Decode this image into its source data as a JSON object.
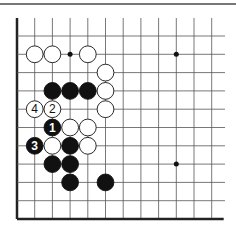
{
  "diagram": {
    "type": "go-board-fragment",
    "grid": {
      "x0": 17,
      "y0": 36,
      "dx": 17.7,
      "dy": 18.3,
      "cols": 12,
      "rows": 11,
      "left_edge": true,
      "bottom_edge": true
    },
    "colors": {
      "line": "#555555",
      "edge": "#222222",
      "black": "#111111",
      "white": "#ffffff",
      "topline": "#777777"
    },
    "star_points": [
      {
        "col": 3,
        "row": 1
      },
      {
        "col": 9,
        "row": 1
      },
      {
        "col": 9,
        "row": 7
      }
    ],
    "stones": [
      {
        "col": 1,
        "row": 1,
        "color": "white",
        "label": ""
      },
      {
        "col": 2,
        "row": 1,
        "color": "white",
        "label": ""
      },
      {
        "col": 4,
        "row": 1,
        "color": "white",
        "label": ""
      },
      {
        "col": 5,
        "row": 2,
        "color": "white",
        "label": ""
      },
      {
        "col": 2,
        "row": 3,
        "color": "black",
        "label": ""
      },
      {
        "col": 3,
        "row": 3,
        "color": "black",
        "label": ""
      },
      {
        "col": 4,
        "row": 3,
        "color": "black",
        "label": ""
      },
      {
        "col": 5,
        "row": 3,
        "color": "white",
        "label": ""
      },
      {
        "col": 1,
        "row": 4,
        "color": "white",
        "label": "4"
      },
      {
        "col": 2,
        "row": 4,
        "color": "white",
        "label": "2"
      },
      {
        "col": 5,
        "row": 4,
        "color": "white",
        "label": ""
      },
      {
        "col": 2,
        "row": 5,
        "color": "black",
        "label": "1"
      },
      {
        "col": 3,
        "row": 5,
        "color": "white",
        "label": ""
      },
      {
        "col": 4,
        "row": 5,
        "color": "white",
        "label": ""
      },
      {
        "col": 1,
        "row": 6,
        "color": "black",
        "label": "3"
      },
      {
        "col": 2,
        "row": 6,
        "color": "white",
        "label": ""
      },
      {
        "col": 3,
        "row": 6,
        "color": "black",
        "label": ""
      },
      {
        "col": 4,
        "row": 6,
        "color": "white",
        "label": ""
      },
      {
        "col": 2,
        "row": 7,
        "color": "black",
        "label": ""
      },
      {
        "col": 3,
        "row": 7,
        "color": "black",
        "label": ""
      },
      {
        "col": 3,
        "row": 8,
        "color": "black",
        "label": ""
      },
      {
        "col": 5,
        "row": 8,
        "color": "black",
        "label": ""
      }
    ]
  }
}
